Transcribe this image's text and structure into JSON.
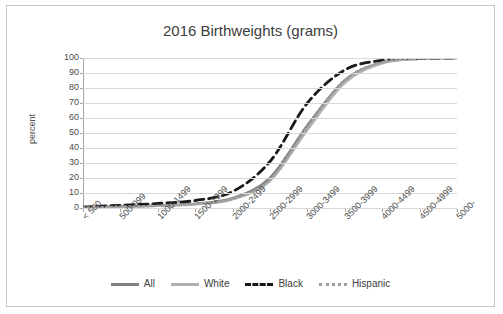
{
  "chart_data": {
    "type": "line",
    "title": "2016 Birthweights (grams)",
    "xlabel": "",
    "ylabel": "percent",
    "ylim": [
      0,
      100
    ],
    "yticks": [
      0,
      10,
      20,
      30,
      40,
      50,
      60,
      70,
      80,
      90,
      100
    ],
    "grid": true,
    "legend_position": "bottom",
    "categories": [
      "< 500",
      "500-999",
      "1000-1499",
      "1500-1999",
      "2000-2499",
      "2500-2999",
      "3000-3499",
      "3500-3999",
      "4000-4499",
      "4500-4999",
      "5000-"
    ],
    "series": [
      {
        "name": "All",
        "style": "solid-gray",
        "color": "#808080",
        "values": [
          0.3,
          1.0,
          1.6,
          2.8,
          6.5,
          20.0,
          55.0,
          85.0,
          97.0,
          99.6,
          100.0
        ]
      },
      {
        "name": "White",
        "style": "solid-light-gray",
        "color": "#a6a6a6",
        "values": [
          0.3,
          0.9,
          1.4,
          2.5,
          5.8,
          18.0,
          52.0,
          83.5,
          96.5,
          99.5,
          100.0
        ]
      },
      {
        "name": "Black",
        "style": "dashed-black",
        "color": "#1a1a1a",
        "values": [
          0.6,
          1.8,
          3.0,
          5.0,
          11.0,
          31.0,
          70.0,
          92.0,
          98.5,
          99.8,
          100.0
        ]
      },
      {
        "name": "Hispanic",
        "style": "dotted-gray",
        "color": "#9e9e9e",
        "values": [
          0.3,
          0.9,
          1.5,
          2.6,
          6.0,
          19.0,
          54.0,
          85.5,
          97.2,
          99.6,
          100.0
        ]
      }
    ]
  },
  "legend": [
    {
      "label": "All"
    },
    {
      "label": "White"
    },
    {
      "label": "Black"
    },
    {
      "label": "Hispanic"
    }
  ]
}
